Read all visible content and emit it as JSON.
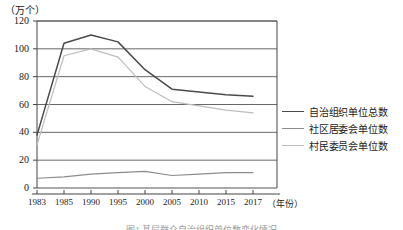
{
  "chart_data": {
    "type": "line",
    "title": "",
    "ylabel": "（万个）",
    "xlabel": "（年份）",
    "categories": [
      "1983",
      "1985",
      "1990",
      "1995",
      "2000",
      "2005",
      "2010",
      "2015",
      "2017"
    ],
    "ylim": [
      0,
      120
    ],
    "yticks": [
      0,
      20,
      40,
      60,
      80,
      100,
      120
    ],
    "grid": true,
    "legend_position": "right",
    "series": [
      {
        "name": "自治组织单位总数",
        "color": "#4a4a4a",
        "values": [
          38,
          104,
          110,
          105,
          85,
          71,
          69,
          67,
          66
        ]
      },
      {
        "name": "社区居委会单位数",
        "color": "#8c8c8c",
        "values": [
          7,
          8,
          10,
          11,
          12,
          9,
          10,
          11,
          11
        ]
      },
      {
        "name": "村民委员会单位数",
        "color": "#bdbdbd",
        "values": [
          31,
          95,
          100,
          94,
          73,
          62,
          59,
          56,
          54
        ]
      }
    ]
  },
  "axes": {
    "y_unit_label": "（万个）",
    "y_tick_labels": [
      "120",
      "100",
      "80",
      "60",
      "40",
      "20",
      "0"
    ],
    "x_tick_labels": [
      "1983",
      "1985",
      "1990",
      "1995",
      "2000",
      "2005",
      "2010",
      "2015",
      "2017"
    ],
    "x_unit_label": "（年份）"
  },
  "legend": {
    "items": [
      {
        "label": "自治组织单位总数",
        "color": "#4a4a4a"
      },
      {
        "label": "社区居委会单位数",
        "color": "#8c8c8c"
      },
      {
        "label": "村民委员会单位数",
        "color": "#bdbdbd"
      }
    ]
  },
  "caption": {
    "text": "图1 基层群众自治组织单位数变化情况"
  }
}
